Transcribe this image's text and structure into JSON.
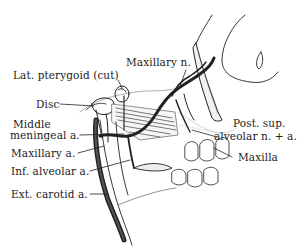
{
  "diagram": {
    "colors": {
      "ink": "#222222",
      "shade": "#8a8a8a",
      "background": "#ffffff"
    },
    "labels": {
      "maxillary_n": "Maxillary n.",
      "lat_pterygoid": "Lat. pterygoid (cut)",
      "disc": "Disc",
      "middle_meningeal_1": "Middle",
      "middle_meningeal_2": "meningeal a.",
      "maxillary_a": "Maxillary a.",
      "inf_alveolar": "Inf. alveolar a.",
      "ext_carotid": "Ext. carotid a.",
      "post_sup_1": "Post. sup.",
      "post_sup_2": "alveolar n. + a.",
      "maxilla": "Maxilla"
    }
  }
}
